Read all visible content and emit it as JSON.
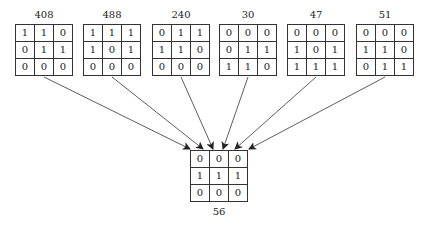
{
  "diagram": {
    "sources": [
      {
        "label": "408",
        "left": 15,
        "cells": [
          [
            "1",
            "1",
            "0"
          ],
          [
            "0",
            "1",
            "1"
          ],
          [
            "0",
            "0",
            "0"
          ]
        ]
      },
      {
        "label": "488",
        "left": 83,
        "cells": [
          [
            "1",
            "1",
            "1"
          ],
          [
            "1",
            "0",
            "1"
          ],
          [
            "0",
            "0",
            "0"
          ]
        ]
      },
      {
        "label": "240",
        "left": 152,
        "cells": [
          [
            "0",
            "1",
            "1"
          ],
          [
            "1",
            "1",
            "0"
          ],
          [
            "0",
            "0",
            "0"
          ]
        ]
      },
      {
        "label": "30",
        "left": 219,
        "cells": [
          [
            "0",
            "0",
            "0"
          ],
          [
            "0",
            "1",
            "1"
          ],
          [
            "1",
            "1",
            "0"
          ]
        ]
      },
      {
        "label": "47",
        "left": 287,
        "cells": [
          [
            "0",
            "0",
            "0"
          ],
          [
            "1",
            "0",
            "1"
          ],
          [
            "1",
            "1",
            "1"
          ]
        ]
      },
      {
        "label": "51",
        "left": 356,
        "cells": [
          [
            "0",
            "0",
            "0"
          ],
          [
            "1",
            "1",
            "0"
          ],
          [
            "0",
            "1",
            "1"
          ]
        ]
      }
    ],
    "target": {
      "label": "56",
      "left": 190,
      "cells": [
        [
          "0",
          "0",
          "0"
        ],
        [
          "1",
          "1",
          "1"
        ],
        [
          "0",
          "0",
          "0"
        ]
      ]
    },
    "arrows": [
      {
        "from": [
          44,
          77
        ],
        "to": [
          190,
          149
        ]
      },
      {
        "from": [
          112,
          77
        ],
        "to": [
          203,
          149
        ]
      },
      {
        "from": [
          181,
          77
        ],
        "to": [
          213,
          149
        ]
      },
      {
        "from": [
          248,
          77
        ],
        "to": [
          223,
          149
        ]
      },
      {
        "from": [
          316,
          77
        ],
        "to": [
          235,
          149
        ]
      },
      {
        "from": [
          385,
          77
        ],
        "to": [
          249,
          149
        ]
      }
    ],
    "line_color": "#333333"
  }
}
